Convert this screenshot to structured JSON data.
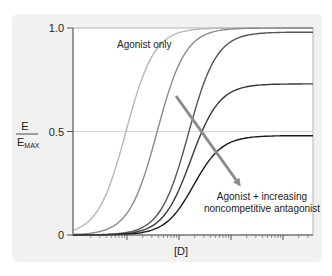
{
  "chart_data": {
    "type": "line",
    "title": "",
    "xlabel": "[D]",
    "ylabel": "E / E_MAX",
    "ylabel_num": "E",
    "ylabel_den_main": "E",
    "ylabel_den_sub": "MAX",
    "x_scale": "log",
    "ylim": [
      0,
      1.0
    ],
    "yticks": [
      "0",
      "0.5",
      "1.0"
    ],
    "grid": "horizontal line at 0.5",
    "legend": "none",
    "annotations": [
      {
        "text": "Agonist only"
      },
      {
        "text_line1": "Agonist + increasing",
        "text_line2": "noncompetitive antagonist",
        "arrow": "down-right, indicating decreasing maximal response"
      }
    ],
    "series": [
      {
        "name": "Agonist only",
        "emax": 1.0,
        "ec50_log": 0.0,
        "color": "#b8b8b8"
      },
      {
        "name": "Antagonist level 1",
        "emax": 1.0,
        "ec50_log": 0.6,
        "color": "#8a8a8a"
      },
      {
        "name": "Antagonist level 2",
        "emax": 0.98,
        "ec50_log": 1.2,
        "color": "#555555"
      },
      {
        "name": "Antagonist level 3",
        "emax": 0.73,
        "ec50_log": 1.25,
        "color": "#3a3a3a"
      },
      {
        "name": "Antagonist level 4",
        "emax": 0.48,
        "ec50_log": 1.3,
        "color": "#1a1a1a"
      }
    ]
  },
  "labels": {
    "y_top": "1.0",
    "y_mid": "0.5",
    "y_bot": "0",
    "y_num": "E",
    "y_den": "E",
    "y_den_sub": "MAX",
    "x_axis": "[D]",
    "agonist_only": "Agonist only",
    "antag_line1": "Agonist + increasing",
    "antag_line2": "noncompetitive antagonist"
  },
  "colors": {
    "panel_bg": "#f1f1f1",
    "plot_bg": "#ffffff",
    "axis": "#555555",
    "arrow": "#8c8c8c"
  }
}
